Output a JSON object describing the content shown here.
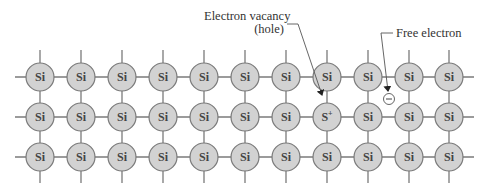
{
  "diagram": {
    "colors": {
      "atom_fill": "#d2d2d2",
      "atom_stroke": "#7a7a7a",
      "bond": "#7a7a7a",
      "leader": "#555555",
      "text": "#333333"
    },
    "lattice": {
      "columns_x": [
        40,
        81,
        122,
        163,
        204,
        245,
        286,
        327,
        368,
        409,
        449
      ],
      "rows_y": [
        77,
        117,
        157
      ],
      "atom_radius": 14,
      "stub_top_y": 50,
      "stub_bottom_y": 183,
      "stub_left_x": 15,
      "stub_right_x": 474,
      "atoms": [
        [
          "Si",
          "Si",
          "Si",
          "Si",
          "Si",
          "Si",
          "Si",
          "Si",
          "Si",
          "Si",
          "Si"
        ],
        [
          "Si",
          "Si",
          "Si",
          "Si",
          "Si",
          "Si",
          "Si",
          "S+",
          "Si",
          "Si",
          "Si"
        ],
        [
          "Si",
          "Si",
          "Si",
          "Si",
          "Si",
          "Si",
          "Si",
          "Si",
          "Si",
          "Si",
          "Si"
        ]
      ]
    },
    "labels": {
      "hole_line1": "Electron vacancy",
      "hole_line2": "(hole)",
      "free_electron": "Free electron",
      "electron_symbol": "−",
      "ion_base": "S",
      "ion_sup": "+"
    },
    "free_electron": {
      "cx": 389,
      "cy": 99,
      "r": 5.5
    },
    "hole_arrow_tip": {
      "x": 322,
      "y": 97
    }
  }
}
